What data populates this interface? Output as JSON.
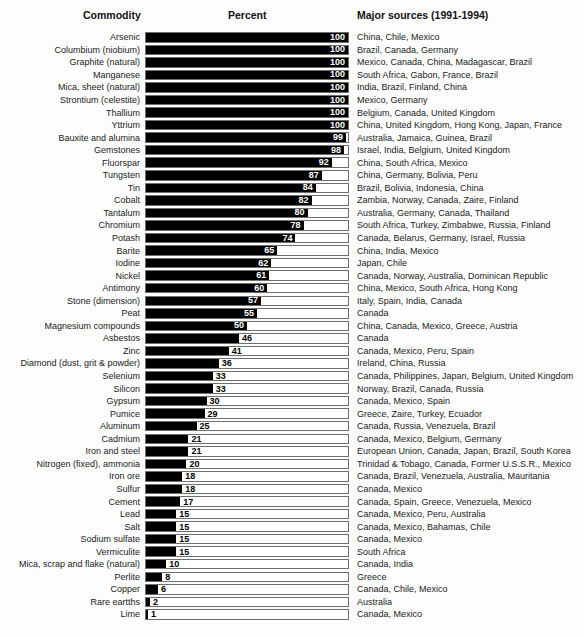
{
  "headers": {
    "commodity": "Commodity",
    "percent": "Percent",
    "sources": "Major sources (1991-1994)"
  },
  "colors": {
    "bar": "#000000",
    "box_border": "#6e6e6e",
    "value_inside": "#ffffff",
    "value_outside": "#000000",
    "background": "#fdfdfd"
  },
  "chart_data": {
    "type": "bar",
    "orientation": "horizontal",
    "xlabel": "Percent",
    "xlim": [
      0,
      100
    ],
    "grid": false,
    "value_label_inside_threshold": 50,
    "rows": [
      {
        "commodity": "Arsenic",
        "value": 100,
        "sources": "China, Chile, Mexico"
      },
      {
        "commodity": "Columbium (niobium)",
        "value": 100,
        "sources": "Brazil, Canada, Germany"
      },
      {
        "commodity": "Graphite (natural)",
        "value": 100,
        "sources": "Mexico, Canada, China, Madagascar, Brazil"
      },
      {
        "commodity": "Manganese",
        "value": 100,
        "sources": "South Africa, Gabon, France, Brazil"
      },
      {
        "commodity": "Mica, sheet (natural)",
        "value": 100,
        "sources": "India, Brazil, Finland, China"
      },
      {
        "commodity": "Strontium (celestite)",
        "value": 100,
        "sources": "Mexico, Germany"
      },
      {
        "commodity": "Thallium",
        "value": 100,
        "sources": "Belgium, Canada, United Kingdom"
      },
      {
        "commodity": "Yttrium",
        "value": 100,
        "sources": "China, United Kingdom, Hong Kong, Japan, France"
      },
      {
        "commodity": "Bauxite and alumina",
        "value": 99,
        "sources": "Australia, Jamaica, Guinea, Brazil"
      },
      {
        "commodity": "Gemstones",
        "value": 98,
        "sources": "Israel, India, Belgium, United Kingdom"
      },
      {
        "commodity": "Fluorspar",
        "value": 92,
        "sources": "China, South Africa, Mexico"
      },
      {
        "commodity": "Tungsten",
        "value": 87,
        "sources": "China, Germany, Bolivia, Peru"
      },
      {
        "commodity": "Tin",
        "value": 84,
        "sources": "Brazil, Bolivia, Indonesia, China"
      },
      {
        "commodity": "Cobalt",
        "value": 82,
        "sources": "Zambia, Norway, Canada, Zaire, Finland"
      },
      {
        "commodity": "Tantalum",
        "value": 80,
        "sources": "Australia, Germany, Canada, Thailand"
      },
      {
        "commodity": "Chromium",
        "value": 78,
        "sources": "South Africa, Turkey, Zimbabwe, Russia, Finland"
      },
      {
        "commodity": "Potash",
        "value": 74,
        "sources": "Canada, Belarus, Germany, Israel, Russia"
      },
      {
        "commodity": "Barite",
        "value": 65,
        "sources": "China, India, Mexico"
      },
      {
        "commodity": "Iodine",
        "value": 62,
        "sources": "Japan, Chile"
      },
      {
        "commodity": "Nickel",
        "value": 61,
        "sources": "Canada, Norway, Australia, Dominican Republic"
      },
      {
        "commodity": "Antimony",
        "value": 60,
        "sources": "China, Mexico, South Africa, Hong Kong"
      },
      {
        "commodity": "Stone (dimension)",
        "value": 57,
        "sources": "Italy, Spain, India, Canada"
      },
      {
        "commodity": "Peat",
        "value": 55,
        "sources": "Canada"
      },
      {
        "commodity": "Magnesium compounds",
        "value": 50,
        "sources": "China, Canada, Mexico, Greece, Austria"
      },
      {
        "commodity": "Asbestos",
        "value": 46,
        "sources": "Canada"
      },
      {
        "commodity": "Zinc",
        "value": 41,
        "sources": "Canada, Mexico, Peru, Spain"
      },
      {
        "commodity": "Diamond (dust, grit & powder)",
        "value": 36,
        "sources": "Ireland, China, Russia"
      },
      {
        "commodity": "Selenium",
        "value": 33,
        "sources": "Canada, Philippines, Japan, Belgium, United Kingdom"
      },
      {
        "commodity": "Silicon",
        "value": 33,
        "sources": "Norway, Brazil, Canada, Russia"
      },
      {
        "commodity": "Gypsum",
        "value": 30,
        "sources": "Canada, Mexico, Spain"
      },
      {
        "commodity": "Pumice",
        "value": 29,
        "sources": "Greece, Zaire, Turkey, Ecuador"
      },
      {
        "commodity": "Aluminum",
        "value": 25,
        "sources": "Canada, Russia, Venezuela, Brazil"
      },
      {
        "commodity": "Cadmium",
        "value": 21,
        "sources": "Canada, Mexico, Belgium, Germany"
      },
      {
        "commodity": "Iron and steel",
        "value": 21,
        "sources": "European Union, Canada, Japan, Brazil, South Korea"
      },
      {
        "commodity": "Nitrogen (fixed), ammonia",
        "value": 20,
        "sources": "Trinidad & Tobago, Canada, Former U.S.S.R., Mexico"
      },
      {
        "commodity": "Iron ore",
        "value": 18,
        "sources": "Canada, Brazil, Venezuela, Australia, Mauritania"
      },
      {
        "commodity": "Sulfur",
        "value": 18,
        "sources": "Canada, Mexico"
      },
      {
        "commodity": "Cement",
        "value": 17,
        "sources": "Canada, Spain, Greece, Venezuela, Mexico"
      },
      {
        "commodity": "Lead",
        "value": 15,
        "sources": "Canada, Mexico, Peru, Australia"
      },
      {
        "commodity": "Salt",
        "value": 15,
        "sources": "Canada, Mexico, Bahamas, Chile"
      },
      {
        "commodity": "Sodium sulfate",
        "value": 15,
        "sources": "Canada, Mexico"
      },
      {
        "commodity": "Vermiculite",
        "value": 15,
        "sources": "South Africa"
      },
      {
        "commodity": "Mica, scrap and flake (natural)",
        "value": 10,
        "sources": "Canada, India"
      },
      {
        "commodity": "Perlite",
        "value": 8,
        "sources": "Greece"
      },
      {
        "commodity": "Copper",
        "value": 6,
        "sources": "Canada, Chile, Mexico"
      },
      {
        "commodity": "Rare eartths",
        "value": 2,
        "sources": "Australia"
      },
      {
        "commodity": "Lime",
        "value": 1,
        "sources": "Canada, Mexico"
      }
    ]
  }
}
